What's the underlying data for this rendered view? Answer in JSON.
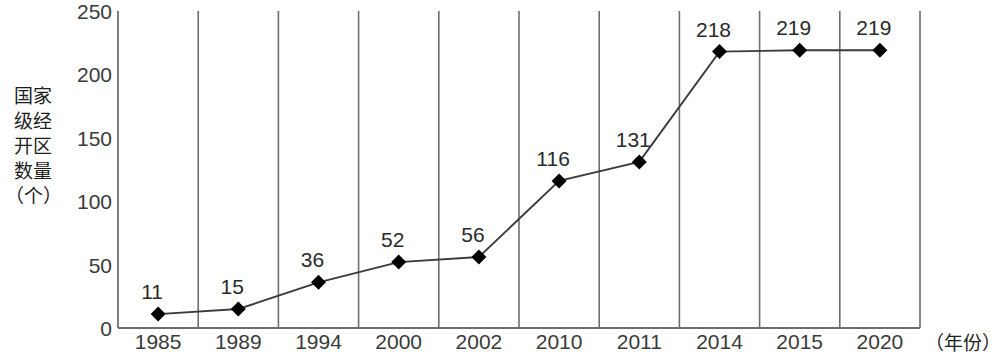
{
  "chart_data": {
    "type": "line",
    "title": "",
    "xlabel": "（年份）",
    "ylabel": "国家级经开区数量（个）",
    "ylabel_lines": [
      "国家",
      "级经",
      "开区",
      "数量",
      "（个）"
    ],
    "categories": [
      "1985",
      "1989",
      "1994",
      "2000",
      "2002",
      "2010",
      "2011",
      "2014",
      "2015",
      "2020"
    ],
    "values": [
      11,
      15,
      36,
      52,
      56,
      116,
      131,
      218,
      219,
      219
    ],
    "point_labels": [
      "11",
      "15",
      "36",
      "52",
      "56",
      "116",
      "131",
      "218",
      "219",
      "219"
    ],
    "ylim": [
      0,
      250
    ],
    "yticks": [
      0,
      50,
      100,
      150,
      200,
      250
    ],
    "ytick_labels": [
      "0",
      "50",
      "100",
      "150",
      "200",
      "250"
    ],
    "grid": "vertical-category-separators",
    "legend": "none",
    "series": [
      {
        "name": "国家级经开区数量（个）",
        "values": [
          11,
          15,
          36,
          52,
          56,
          116,
          131,
          218,
          219,
          219
        ],
        "marker": "diamond",
        "marker_color": "#000000",
        "line_color": "#3b3b3b"
      }
    ]
  },
  "style": {
    "background": "#ffffff",
    "axis_color": "#6e6e6e",
    "gridline_color": "#6e6e6e",
    "line_color": "#3b3b3b",
    "marker_color": "#000000",
    "text_color": "#2b2b2b"
  }
}
